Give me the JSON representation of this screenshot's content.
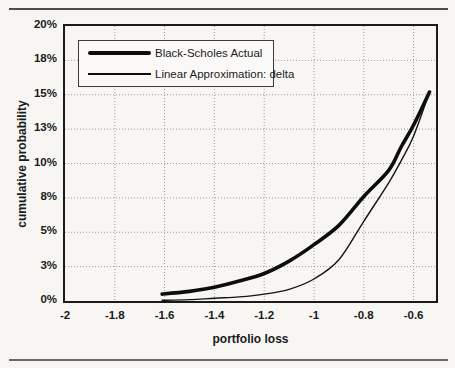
{
  "figure": {
    "background": "#f7f6f3",
    "top_rule_color": "#4c4c4c",
    "bottom_rule_color": "#6a6a6a",
    "grid_color": "#9c9c9c",
    "curve_color": "#0d0d0d"
  },
  "chart_data": {
    "type": "line",
    "title": "",
    "xlabel": "portfolio loss",
    "ylabel": "cumulative probability",
    "xlim": [
      -2,
      -0.51
    ],
    "ylim": [
      0,
      20
    ],
    "grid": "dotted",
    "legend_position": "top-left-inside",
    "x_ticks": [
      {
        "value": -2,
        "label": "-2"
      },
      {
        "value": -1.8,
        "label": "-1.8"
      },
      {
        "value": -1.6,
        "label": "-1.6"
      },
      {
        "value": -1.4,
        "label": "-1.4"
      },
      {
        "value": -1.2,
        "label": "-1.2"
      },
      {
        "value": -1,
        "label": "-1"
      },
      {
        "value": -0.8,
        "label": "-0.8"
      },
      {
        "value": -0.6,
        "label": "-0.6"
      }
    ],
    "y_ticks": [
      {
        "value": 0,
        "label": "0%"
      },
      {
        "value": 2.5,
        "label": "3%"
      },
      {
        "value": 5,
        "label": "5%"
      },
      {
        "value": 7.5,
        "label": "8%"
      },
      {
        "value": 10,
        "label": "10%"
      },
      {
        "value": 12.5,
        "label": "13%"
      },
      {
        "value": 15,
        "label": "15%"
      },
      {
        "value": 17.5,
        "label": "18%"
      },
      {
        "value": 20,
        "label": "20%"
      }
    ],
    "series": [
      {
        "name": "Black-Scholes Actual",
        "style": "thick",
        "color": "#0d0d0d",
        "width": 3.6,
        "points": [
          [
            -1.61,
            0.5
          ],
          [
            -1.5,
            0.7
          ],
          [
            -1.4,
            1.0
          ],
          [
            -1.3,
            1.45
          ],
          [
            -1.2,
            2.0
          ],
          [
            -1.1,
            2.9
          ],
          [
            -1.0,
            4.1
          ],
          [
            -0.9,
            5.5
          ],
          [
            -0.8,
            7.6
          ],
          [
            -0.7,
            9.5
          ],
          [
            -0.65,
            11.2
          ],
          [
            -0.6,
            12.8
          ],
          [
            -0.536,
            15.2
          ]
        ]
      },
      {
        "name": "Linear Approximation: delta",
        "style": "thin",
        "color": "#141414",
        "width": 1.4,
        "points": [
          [
            -1.61,
            0.05
          ],
          [
            -1.5,
            0.1
          ],
          [
            -1.4,
            0.2
          ],
          [
            -1.3,
            0.3
          ],
          [
            -1.2,
            0.5
          ],
          [
            -1.1,
            0.85
          ],
          [
            -1.0,
            1.6
          ],
          [
            -0.9,
            3.0
          ],
          [
            -0.8,
            5.8
          ],
          [
            -0.7,
            8.6
          ],
          [
            -0.65,
            10.2
          ],
          [
            -0.6,
            12.0
          ],
          [
            -0.536,
            15.2
          ]
        ]
      }
    ]
  }
}
